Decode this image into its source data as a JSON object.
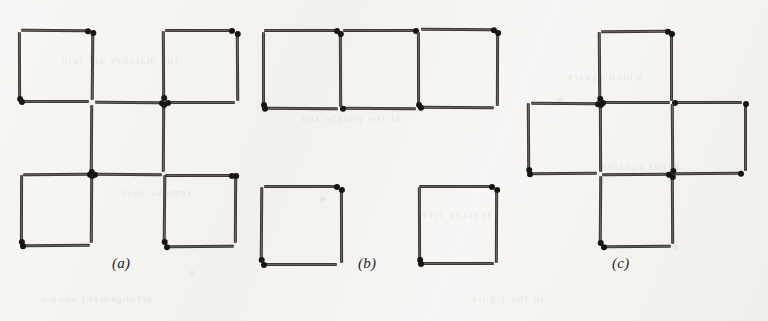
{
  "figure": {
    "kind": "matchstick-puzzle-diagram",
    "background_color": "#f6f5f3",
    "match_body_color": "#4a4540",
    "match_head_color": "#17150f",
    "caption_color": "#24211e",
    "match_length": 72,
    "match_thickness": 6,
    "panels": [
      {
        "id": "a",
        "caption": "(a)",
        "caption_x": 112,
        "caption_y": 255,
        "origin_x": 20,
        "origin_y": 30,
        "cell": 72,
        "square_count": 5,
        "squares": [
          {
            "col": 0,
            "row": 0
          },
          {
            "col": 2,
            "row": 0
          },
          {
            "col": 1,
            "row": 1
          },
          {
            "col": 0,
            "row": 2
          },
          {
            "col": 2,
            "row": 2
          }
        ]
      },
      {
        "id": "b",
        "caption": "(b)",
        "caption_x": 358,
        "caption_y": 255,
        "origin_x": 262,
        "origin_y": 30,
        "cell": 78,
        "square_count": 5,
        "squares": [
          {
            "col": 0,
            "row": 0
          },
          {
            "col": 1,
            "row": 0
          },
          {
            "col": 2,
            "row": 0
          },
          {
            "col": 0,
            "row": 2
          },
          {
            "col": 2,
            "row": 2
          }
        ]
      },
      {
        "id": "c",
        "caption": "(c)",
        "caption_x": 612,
        "caption_y": 255,
        "origin_x": 528,
        "origin_y": 30,
        "cell": 72,
        "square_count": 5,
        "squares": [
          {
            "col": 1,
            "row": 0
          },
          {
            "col": 0,
            "row": 1
          },
          {
            "col": 1,
            "row": 1
          },
          {
            "col": 2,
            "row": 1
          },
          {
            "col": 1,
            "row": 2
          }
        ]
      }
    ],
    "show_through_text": [
      {
        "text": "the matches are laid",
        "x": 60,
        "y": 54
      },
      {
        "text": "of the puzzle and",
        "x": 300,
        "y": 112
      },
      {
        "text": "which square",
        "x": 566,
        "y": 70
      },
      {
        "text": "remove four",
        "x": 120,
        "y": 186
      },
      {
        "text": "leaving five",
        "x": 420,
        "y": 208
      },
      {
        "text": "equal squares",
        "x": 600,
        "y": 160
      },
      {
        "text": "arrangement shown",
        "x": 40,
        "y": 292
      },
      {
        "text": "in the figure",
        "x": 470,
        "y": 292
      }
    ]
  }
}
